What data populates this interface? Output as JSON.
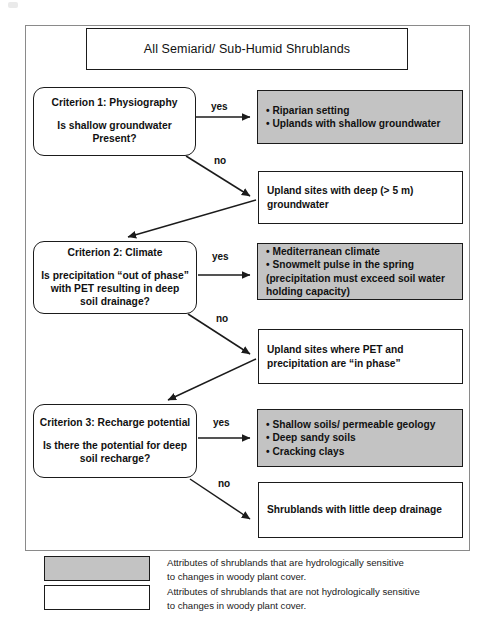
{
  "figure": {
    "title_box": "All Semiarid/ Sub-Humid Shrublands"
  },
  "nodes": {
    "criterion1": {
      "heading": "Criterion 1: Physiography",
      "question_line1": "Is shallow groundwater",
      "question_line2": "Present?"
    },
    "criterion2": {
      "heading": "Criterion 2: Climate",
      "question_line1": "Is precipitation “out of phase”",
      "question_line2": "with PET resulting in deep",
      "question_line3": "soil drainage?"
    },
    "criterion3": {
      "heading": "Criterion 3: Recharge potential",
      "question_line1": "Is there the potential for deep",
      "question_line2": "soil recharge?"
    },
    "outcome1_yes": {
      "bullets": [
        "• Riparian setting",
        "• Uplands with shallow groundwater"
      ],
      "shaded": true
    },
    "outcome1_no": {
      "line1": "Upland sites with deep (> 5 m)",
      "line2": "groundwater",
      "shaded": false
    },
    "outcome2_yes": {
      "bullets": [
        "• Mediterranean climate",
        "• Snowmelt pulse in the spring",
        "(precipitation must exceed soil water",
        "holding capacity)"
      ],
      "shaded": true
    },
    "outcome2_no": {
      "line1": "Upland sites where PET and",
      "line2": "precipitation are “in phase”",
      "shaded": false
    },
    "outcome3_yes": {
      "bullets": [
        "• Shallow soils/ permeable geology",
        "• Deep sandy soils",
        "• Cracking clays"
      ],
      "shaded": true
    },
    "outcome3_no": {
      "line1": "Shrublands with little deep drainage",
      "shaded": false
    }
  },
  "edge_labels": {
    "yes1": "yes",
    "no1": "no",
    "yes2": "yes",
    "no2": "no",
    "yes3": "yes",
    "no3": "no"
  },
  "legend": {
    "items": [
      {
        "swatch": "shaded",
        "line1": "Attributes of shrublands that are hydrologically sensitive",
        "line2": "to changes in woody plant cover."
      },
      {
        "swatch": "unshaded",
        "line1": "Attributes of shrublands that are not hydrologically sensitive",
        "line2": "to changes in woody plant cover."
      }
    ]
  },
  "colors": {
    "shaded_fill": "#c3c3c3",
    "unshaded_fill": "#ffffff",
    "stroke": "#1b1b1b",
    "frame_stroke": "#8a8a8a"
  }
}
